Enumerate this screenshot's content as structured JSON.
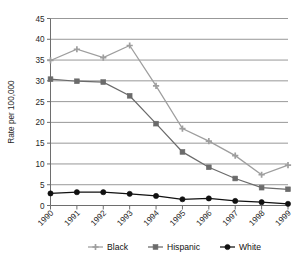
{
  "chart_data": {
    "type": "line",
    "title": "",
    "xlabel": "",
    "ylabel": "Rate per 100,000",
    "categories": [
      "1990",
      "1991",
      "1992",
      "1993",
      "1994",
      "1995",
      "1996",
      "1997",
      "1998",
      "1999"
    ],
    "xlim": [
      0,
      9
    ],
    "ylim": [
      0,
      45
    ],
    "ytick_step": 5,
    "yticks": [
      "0",
      "5",
      "10",
      "15",
      "20",
      "25",
      "30",
      "35",
      "40",
      "45"
    ],
    "grid": true,
    "grid_axis": "y",
    "legend_position": "bottom",
    "series": [
      {
        "name": "Black",
        "color": "#9e9e9e",
        "marker": "cross-marker",
        "values": [
          34.9,
          37.6,
          35.6,
          38.5,
          28.8,
          18.5,
          15.5,
          12.0,
          7.4,
          9.7
        ]
      },
      {
        "name": "Hispanic",
        "color": "#6b6b6b",
        "marker": "square-marker",
        "values": [
          30.4,
          29.9,
          29.7,
          26.4,
          19.7,
          12.9,
          9.2,
          6.5,
          4.3,
          3.9
        ]
      },
      {
        "name": "White",
        "color": "#111111",
        "marker": "circle-marker",
        "values": [
          2.9,
          3.2,
          3.2,
          2.8,
          2.3,
          1.5,
          1.7,
          1.1,
          0.8,
          0.4
        ]
      }
    ]
  },
  "legend": {
    "items": [
      {
        "label": "Black"
      },
      {
        "label": "Hispanic"
      },
      {
        "label": "White"
      }
    ]
  },
  "axes": {
    "y_axis_title": "Rate per 100,000"
  }
}
